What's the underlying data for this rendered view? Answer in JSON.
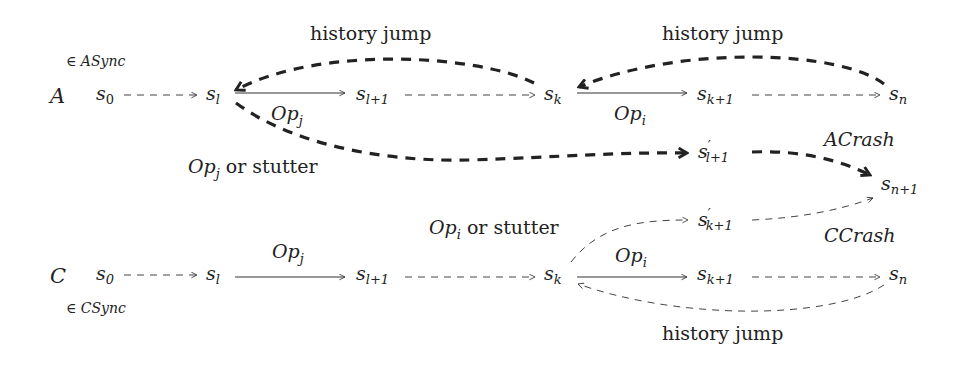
{
  "diagram": {
    "rows": {
      "A": {
        "label": "A",
        "set": "∈ ASync",
        "nodes": [
          {
            "id": "s0",
            "base": "s",
            "sub": "0"
          },
          {
            "id": "sl",
            "base": "s",
            "sub": "l"
          },
          {
            "id": "sl1",
            "base": "s",
            "sub": "l+1"
          },
          {
            "id": "sk",
            "base": "s",
            "sub": "k"
          },
          {
            "id": "sk1",
            "base": "s",
            "sub": "k+1"
          },
          {
            "id": "sn",
            "base": "s",
            "sub": "n"
          }
        ],
        "edge_labels": {
          "opj": "Op",
          "opj_sub": "j",
          "opi": "Op",
          "opi_sub": "i",
          "history_jump_left": "history jump",
          "history_jump_right": "history jump",
          "opj_or_stutter": "Op",
          "opj_or_stutter_sub": "j",
          "opj_or_stutter_text": "or stutter",
          "acrash": "ACrash"
        },
        "branch_node": {
          "base": "s",
          "prime": "′",
          "sub": "l+1"
        }
      },
      "C": {
        "label": "C",
        "set": "∈ CSync",
        "nodes": [
          {
            "id": "s0",
            "base": "s",
            "sub": "0"
          },
          {
            "id": "sl",
            "base": "s",
            "sub": "l"
          },
          {
            "id": "sl1",
            "base": "s",
            "sub": "l+1"
          },
          {
            "id": "sk",
            "base": "s",
            "sub": "k"
          },
          {
            "id": "sk1",
            "base": "s",
            "sub": "k+1"
          },
          {
            "id": "sn",
            "base": "s",
            "sub": "n"
          }
        ],
        "edge_labels": {
          "opj": "Op",
          "opj_sub": "j",
          "opi": "Op",
          "opi_sub": "i",
          "history_jump": "history jump",
          "opi_or_stutter": "Op",
          "opi_or_stutter_sub": "i",
          "opi_or_stutter_text": "or stutter",
          "ccrash": "CCrash"
        },
        "branch_node": {
          "base": "s",
          "prime": "′",
          "sub": "k+1"
        }
      }
    },
    "shared_node": {
      "base": "s",
      "sub": "n+1"
    }
  }
}
